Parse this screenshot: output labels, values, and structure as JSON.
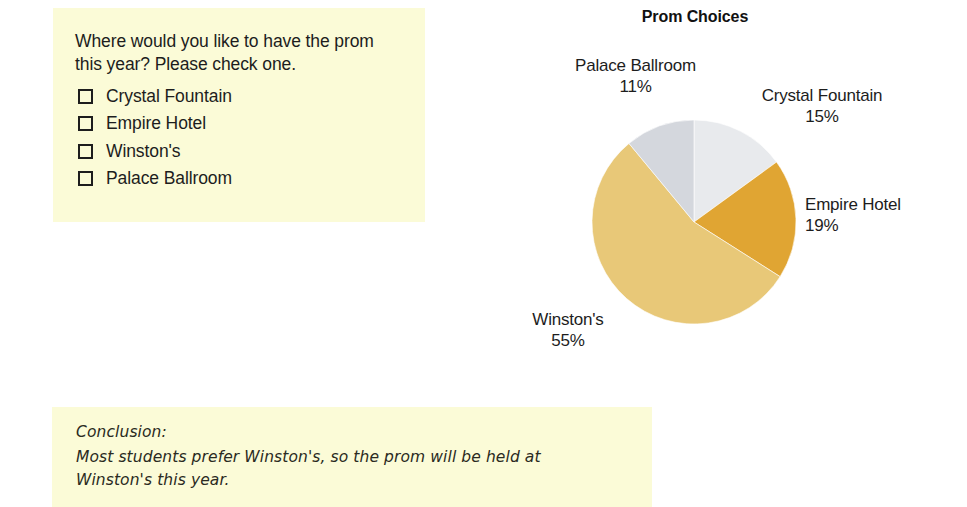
{
  "survey": {
    "question": "Where would you like to have the prom this year? Please check one.",
    "checkbox_icon": "checkbox-empty-icon",
    "options": [
      {
        "label": "Crystal Fountain"
      },
      {
        "label": "Empire Hotel"
      },
      {
        "label": "Winston's"
      },
      {
        "label": "Palace Ballroom"
      }
    ],
    "background_color": "#fbfbd7"
  },
  "conclusion": {
    "heading": "Conclusion:",
    "line1": "Most students prefer Winston's, so the prom will be held at",
    "line2": "Winston's this year.",
    "background_color": "#fbfbd7"
  },
  "chart_labels": {
    "palace": {
      "name": "Palace Ballroom",
      "pct": "11%"
    },
    "crystal": {
      "name": "Crystal Fountain",
      "pct": "15%"
    },
    "empire": {
      "name": "Empire Hotel",
      "pct": "19%"
    },
    "winstons": {
      "name": "Winston's",
      "pct": "55%"
    }
  },
  "chart_data": {
    "type": "pie",
    "title": "Prom Choices",
    "xlabel": "",
    "ylabel": "",
    "legend_position": "none",
    "grid": false,
    "units": "percent",
    "start_angle_deg": 0,
    "direction": "clockwise",
    "categories": [
      "Crystal Fountain",
      "Empire Hotel",
      "Winston's",
      "Palace Ballroom"
    ],
    "values": [
      15,
      19,
      55,
      11
    ],
    "labels": [
      "15%",
      "19%",
      "55%",
      "11%"
    ],
    "colors": [
      "#e8eaed",
      "#e0a533",
      "#e8c878",
      "#d4d7dd"
    ],
    "slices": [
      {
        "name": "Crystal Fountain",
        "value": 15,
        "label": "15%",
        "color": "#e8eaed"
      },
      {
        "name": "Empire Hotel",
        "value": 19,
        "label": "19%",
        "color": "#e0a533"
      },
      {
        "name": "Winston's",
        "value": 55,
        "label": "55%",
        "color": "#e8c878"
      },
      {
        "name": "Palace Ballroom",
        "value": 11,
        "label": "11%",
        "color": "#d4d7dd"
      }
    ]
  }
}
